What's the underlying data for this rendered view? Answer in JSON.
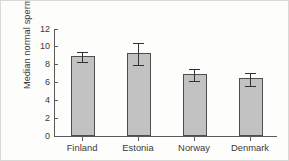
{
  "chart_data": {
    "type": "bar",
    "title": "",
    "xlabel": "",
    "ylabel": "Median normal spermatozoa (%)",
    "categories": [
      "Finland",
      "Estonia",
      "Norway",
      "Denmark"
    ],
    "values": [
      8.9,
      9.2,
      6.9,
      6.4
    ],
    "errors": [
      0.6,
      1.2,
      0.7,
      0.7
    ],
    "series": [
      {
        "name": "Median normal spermatozoa",
        "values": [
          8.9,
          9.2,
          6.9,
          6.4
        ],
        "errors": [
          0.6,
          1.2,
          0.7,
          0.7
        ]
      }
    ],
    "ylim": [
      0,
      12
    ],
    "ytick_labels": [
      "0",
      "2",
      "4",
      "6",
      "8",
      "10",
      "12"
    ],
    "ytick_values": [
      0,
      2,
      4,
      6,
      8,
      10,
      12
    ],
    "grid": false,
    "legend": false,
    "legend_position": "none",
    "bar_color": "#c2c2c2",
    "bar_edge_color": "#4e4e4e",
    "error_bar_color": "#333333",
    "axis_color": "#5a5a5a",
    "background_color": "#fdfdfb"
  }
}
